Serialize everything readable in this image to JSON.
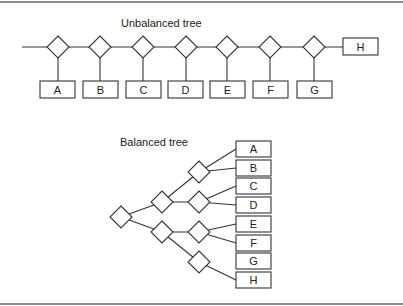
{
  "figure": {
    "unbalanced": {
      "title": "Unbalanced tree",
      "leaves": [
        "A",
        "B",
        "C",
        "D",
        "E",
        "F",
        "G"
      ],
      "last_leaf": "H"
    },
    "balanced": {
      "title": "Balanced tree",
      "leaves": [
        "A",
        "B",
        "C",
        "D",
        "E",
        "F",
        "G",
        "H"
      ]
    }
  }
}
